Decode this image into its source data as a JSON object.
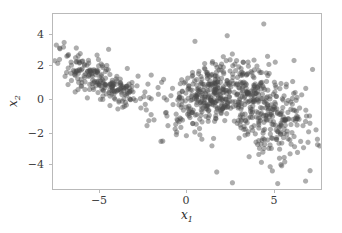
{
  "chart_data": {
    "type": "scatter",
    "title": "",
    "subtitle": "",
    "xlabel": "x_1",
    "ylabel": "x_2",
    "xlabel_base": "x",
    "xlabel_sub": "1",
    "ylabel_base": "x",
    "ylabel_sub": "2",
    "xlim": [
      -7.9,
      7.6
    ],
    "ylim": [
      -5.5,
      5.2
    ],
    "xticks": [
      -5,
      0,
      5
    ],
    "xtick_labels": [
      "−5",
      "0",
      "5"
    ],
    "yticks": [
      4,
      2,
      0,
      -2,
      -4
    ],
    "ytick_labels": [
      "4",
      "2",
      "0",
      "−2",
      "−4"
    ],
    "grid": false,
    "legend": null,
    "marker": {
      "shape": "circle",
      "color": "#4a4a4a",
      "alpha": 0.45,
      "size_px": 5.2,
      "edge": "none"
    },
    "frame_color": "#b9b9b9",
    "background": "#ffffff",
    "n_points": 900,
    "clusters": [
      {
        "name": "cluster-left",
        "n": 230,
        "mean": [
          -4.9,
          1.05
        ],
        "cov": [
          [
            1.95,
            -0.95
          ],
          [
            -0.95,
            0.78
          ]
        ]
      },
      {
        "name": "cluster-middle",
        "n": 330,
        "mean": [
          1.15,
          0.35
        ],
        "cov": [
          [
            1.35,
            0.55
          ],
          [
            0.55,
            1.15
          ]
        ]
      },
      {
        "name": "cluster-right",
        "n": 340,
        "mean": [
          4.25,
          -0.75
        ],
        "cov": [
          [
            1.65,
            -0.5
          ],
          [
            -0.5,
            1.85
          ]
        ]
      }
    ],
    "stray_points": [
      [
        -1.55,
        1.25
      ],
      [
        -1.4,
        -0.75
      ],
      [
        -1.3,
        -1.55
      ],
      [
        -1.85,
        0.35
      ],
      [
        -2.1,
        -1.2
      ],
      [
        -2.4,
        -1.25
      ],
      [
        4.2,
        4.6
      ],
      [
        6.6,
        -4.9
      ],
      [
        5.0,
        -5.05
      ],
      [
        2.4,
        -5.0
      ],
      [
        1.5,
        -4.35
      ],
      [
        0.25,
        3.55
      ],
      [
        -7.5,
        3.1
      ],
      [
        -7.3,
        3.2
      ],
      [
        7.2,
        -1.8
      ],
      [
        7.0,
        1.85
      ]
    ]
  }
}
